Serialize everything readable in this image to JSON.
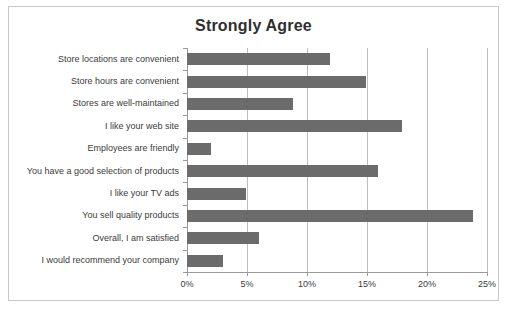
{
  "chart_data": {
    "type": "bar",
    "orientation": "horizontal",
    "title": "Strongly Agree",
    "xlabel": "",
    "ylabel": "",
    "xlim": [
      0,
      25
    ],
    "grid": true,
    "legend": false,
    "xtick_labels": [
      "0%",
      "5%",
      "10%",
      "15%",
      "20%",
      "25%"
    ],
    "xticks": [
      0,
      5,
      10,
      15,
      20,
      25
    ],
    "bar_color": "#6b6b6b",
    "categories": [
      "Store locations are convenient",
      "Store hours are convenient",
      "Stores are well-maintained",
      "I like your web site",
      "Employees are friendly",
      "You have a good selection of products",
      "I like your TV ads",
      "You sell quality products",
      "Overall, I am satisfied",
      "I would recommend your company"
    ],
    "values": [
      11.9,
      14.9,
      8.8,
      17.9,
      2.0,
      15.9,
      4.9,
      23.8,
      6.0,
      3.0
    ]
  }
}
